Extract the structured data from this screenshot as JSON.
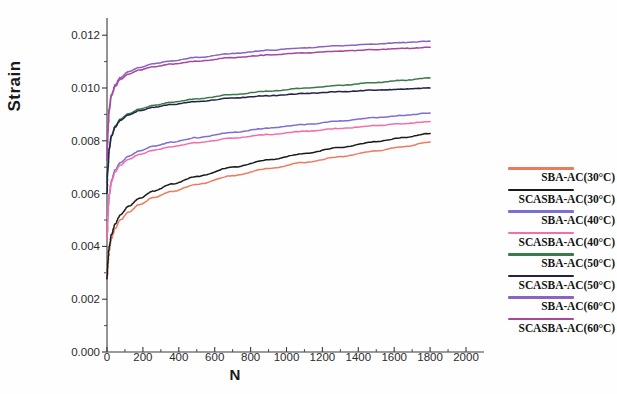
{
  "chart_data": {
    "type": "line",
    "title": "",
    "xlabel": "N",
    "ylabel": "Strain",
    "xlim": [
      0,
      2000
    ],
    "ylim": [
      0,
      0.0125
    ],
    "grid": false,
    "legend_position": "right",
    "xticks": [
      0,
      200,
      400,
      600,
      800,
      1000,
      1200,
      1400,
      1600,
      1800,
      2000
    ],
    "xtick_labels": [
      "0",
      "200",
      "400",
      "600",
      "800",
      "1000",
      "1200",
      "1400",
      "1600",
      "1800",
      "2000"
    ],
    "yticks": [
      0.0,
      0.002,
      0.004,
      0.006,
      0.008,
      0.01,
      0.012
    ],
    "ytick_labels": [
      "0.000",
      "0.002",
      "0.004",
      "0.006",
      "0.008",
      "0.010",
      "0.012"
    ],
    "x": [
      0,
      5,
      12,
      25,
      45,
      75,
      120,
      180,
      260,
      360,
      500,
      700,
      900,
      1100,
      1300,
      1500,
      1650,
      1800
    ],
    "series": [
      {
        "name": "SBA-AC(30°C)",
        "color": "#ee7a5c",
        "values": [
          0.00275,
          0.0033,
          0.00385,
          0.0043,
          0.00468,
          0.005,
          0.0053,
          0.00558,
          0.00585,
          0.00608,
          0.00635,
          0.00668,
          0.00695,
          0.00718,
          0.0074,
          0.00762,
          0.00778,
          0.00795
        ]
      },
      {
        "name": "SCASBA-AC(30°C)",
        "color": "#1a1a1a",
        "values": [
          0.00278,
          0.0034,
          0.00398,
          0.00445,
          0.00485,
          0.0052,
          0.00552,
          0.00582,
          0.0061,
          0.00636,
          0.00665,
          0.007,
          0.00728,
          0.00752,
          0.00775,
          0.00797,
          0.00812,
          0.00828
        ]
      },
      {
        "name": "SBA-AC(40°C)",
        "color": "#7b6ed6",
        "values": [
          0.00432,
          0.0052,
          0.00595,
          0.0065,
          0.0069,
          0.00718,
          0.00742,
          0.00762,
          0.0078,
          0.00795,
          0.00812,
          0.00832,
          0.00848,
          0.00862,
          0.00875,
          0.00888,
          0.00896,
          0.00905
        ]
      },
      {
        "name": "SCASBA-AC(40°C)",
        "color": "#f46fa8",
        "values": [
          0.0043,
          0.00518,
          0.00592,
          0.00645,
          0.00682,
          0.00708,
          0.0073,
          0.00748,
          0.00764,
          0.00778,
          0.00793,
          0.0081,
          0.00824,
          0.00836,
          0.00847,
          0.00858,
          0.00865,
          0.00873
        ]
      },
      {
        "name": "SBA-AC(50°C)",
        "color": "#3b7a4a",
        "values": [
          0.00605,
          0.007,
          0.0077,
          0.0082,
          0.00855,
          0.00882,
          0.00903,
          0.0092,
          0.00934,
          0.00946,
          0.00959,
          0.00975,
          0.00988,
          0.00999,
          0.0101,
          0.01021,
          0.01029,
          0.01038
        ]
      },
      {
        "name": "SCASBA-AC(50°C)",
        "color": "#23234a",
        "values": [
          0.00602,
          0.00698,
          0.00768,
          0.00818,
          0.00852,
          0.00878,
          0.00898,
          0.00914,
          0.00927,
          0.00938,
          0.00949,
          0.00962,
          0.00971,
          0.00979,
          0.00986,
          0.00992,
          0.00996,
          0.01
        ]
      },
      {
        "name": "SBA-AC(60°C)",
        "color": "#8a63c4",
        "values": [
          0.0073,
          0.0084,
          0.0092,
          0.00975,
          0.01012,
          0.0104,
          0.01062,
          0.01078,
          0.01092,
          0.01103,
          0.01116,
          0.01131,
          0.01143,
          0.01152,
          0.0116,
          0.01167,
          0.01172,
          0.01177
        ]
      },
      {
        "name": "SCASBA-AC(60°C)",
        "color": "#a8479b",
        "values": [
          0.00728,
          0.00838,
          0.00917,
          0.00971,
          0.01006,
          0.01033,
          0.01053,
          0.01068,
          0.01081,
          0.01091,
          0.01102,
          0.01115,
          0.01125,
          0.01133,
          0.0114,
          0.01146,
          0.0115,
          0.01154
        ]
      }
    ]
  },
  "axis": {
    "ylabel": "Strain",
    "xlabel": "N"
  }
}
